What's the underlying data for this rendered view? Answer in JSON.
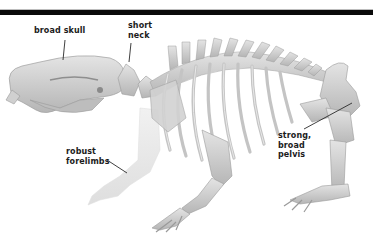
{
  "diagram": {
    "colors": {
      "bar": "#0a0a0a",
      "bone": "#d6d6d6",
      "bone_shadow": "#a9a9a9",
      "bone_faint": "#ececec",
      "label_text": "#1c1c1c",
      "leader": "#2a2a2a"
    },
    "labels": [
      {
        "id": "skull",
        "lines": [
          "broad skull"
        ]
      },
      {
        "id": "neck",
        "lines": [
          "short",
          "neck"
        ]
      },
      {
        "id": "forelimbs",
        "lines": [
          "robust",
          "forelimbs"
        ]
      },
      {
        "id": "pelvis",
        "lines": [
          "strong,",
          "broad",
          "pelvis"
        ]
      }
    ]
  }
}
